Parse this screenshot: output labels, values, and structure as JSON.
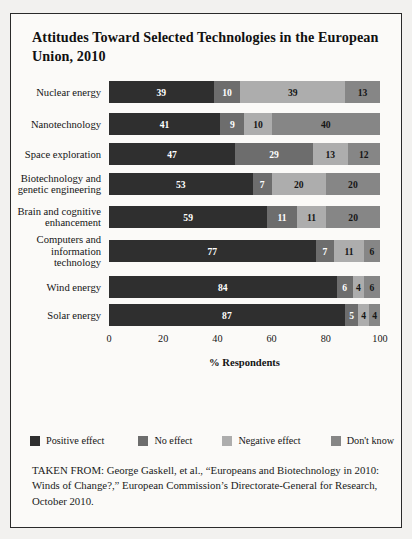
{
  "figure": {
    "title": "Attitudes Toward Selected Technologies in the European Union, 2010",
    "source_note": "TAKEN FROM: George Gaskell, et al., “Europeans and Biotechnology in 2010: Winds of Change?,” European Commission’s Directorate-General for Research, October 2010."
  },
  "colors": {
    "positive_effect": "#2f2f2f",
    "no_effect": "#6d6d6d",
    "negative_effect": "#adadad",
    "dont_know": "#868686",
    "border": "#2a2a2a",
    "panel_background": "#fbfaf8",
    "page_background": "#f2f1ef"
  },
  "chart_data": {
    "type": "bar",
    "orientation": "horizontal",
    "stacked": true,
    "title": "Attitudes Toward Selected Technologies in the European Union, 2010",
    "xlabel": "% Respondents",
    "ylabel": "",
    "xlim": [
      0,
      100
    ],
    "xticks": [
      0,
      20,
      40,
      60,
      80,
      100
    ],
    "xtick_labels": [
      "0",
      "20",
      "40",
      "60",
      "80",
      "100"
    ],
    "grid": false,
    "legend_position": "bottom",
    "categories": [
      "Nuclear energy",
      "Nanotechnology",
      "Space exploration",
      "Biotechnology and genetic engineering",
      "Brain and cognitive enhancement",
      "Computers and information technology",
      "Wind energy",
      "Solar energy"
    ],
    "category_labels_wrapped": [
      "Nuclear energy",
      "Nanotechnology",
      "Space exploration",
      "Biotechnology and\ngenetic engineering",
      "Brain and cognitive\nenhancement",
      "Computers and\ninformation\ntechnology",
      "Wind energy",
      "Solar energy"
    ],
    "series": [
      {
        "name": "Positive effect",
        "color": "#2f2f2f",
        "values": [
          39,
          41,
          47,
          53,
          59,
          77,
          84,
          87
        ]
      },
      {
        "name": "No effect",
        "color": "#6d6d6d",
        "values": [
          10,
          9,
          29,
          7,
          11,
          7,
          6,
          5
        ]
      },
      {
        "name": "Negative effect",
        "color": "#adadad",
        "values": [
          39,
          10,
          13,
          20,
          11,
          11,
          4,
          4
        ]
      },
      {
        "name": "Don't know",
        "color": "#868686",
        "values": [
          13,
          40,
          12,
          20,
          20,
          6,
          6,
          4
        ]
      }
    ]
  },
  "legend": {
    "items": [
      {
        "label": "Positive effect"
      },
      {
        "label": "No effect"
      },
      {
        "label": "Negative effect"
      },
      {
        "label": "Don't know"
      }
    ]
  }
}
